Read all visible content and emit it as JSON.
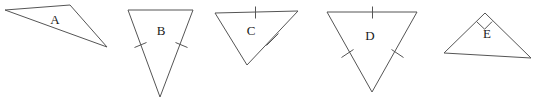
{
  "figure": {
    "background_color": "#ffffff",
    "stroke_color": "#555555",
    "label_color": "#1a1a1a",
    "width": 538,
    "height": 101,
    "shape_count": 5
  },
  "shapes": {
    "a": {
      "label": "A",
      "kind": "scalene-obtuse-triangle",
      "label_x": 55,
      "label_y": 21,
      "points": "5,10 70,5 107,47",
      "congruence_ticks": 0,
      "right_angle": false
    },
    "b": {
      "label": "B",
      "kind": "isosceles-triangle-inverted",
      "label_x": 161,
      "label_y": 32,
      "points": "128,10 193,10 160,97",
      "congruence_ticks": 2,
      "right_angle": false,
      "tick_left": "M 134.5,47.5 L 146.5,42.5",
      "tick_right": "M 175.5,42.5 L 187.5,47.5"
    },
    "c": {
      "label": "C",
      "kind": "isosceles-triangle-inverted",
      "label_x": 251,
      "label_y": 32,
      "points": "215,13 298,11 247,65",
      "congruence_ticks": 2,
      "right_angle": false,
      "tick_top": "M 255.5,6.5 L 255.5,18.5",
      "tick_right": "M 266.5,45.5 L 278.5,33.5"
    },
    "d": {
      "label": "D",
      "kind": "equilateral-triangle-inverted",
      "label_x": 370,
      "label_y": 37,
      "points": "327,12 417,12 372,92",
      "congruence_ticks": 3,
      "right_angle": false,
      "tick_top": "M 372.5,6.5 L 372.5,18.5",
      "tick_left": "M 341.5,57.5 L 353.5,49.5",
      "tick_right": "M 391.5,49.5 L 403.5,57.5"
    },
    "e": {
      "label": "E",
      "kind": "right-triangle",
      "label_x": 487,
      "label_y": 35,
      "points": "444,53 485,13 531,58",
      "congruence_ticks": 0,
      "right_angle": true,
      "right_angle_mark": "M 476.6,21.6 L 484.6,29.2 L 492.1,21.6"
    }
  }
}
